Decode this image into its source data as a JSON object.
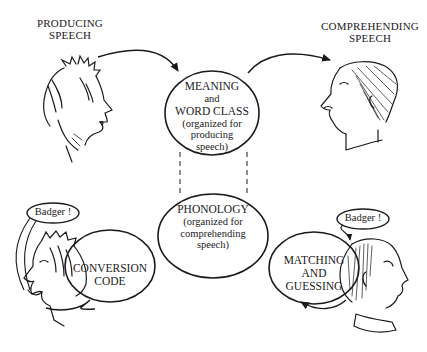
{
  "diagram": {
    "captions": {
      "producing": [
        "PRODUCING",
        "SPEECH"
      ],
      "comprehending": [
        "COMPREHENDING",
        "SPEECH"
      ]
    },
    "nodes": {
      "meaning": {
        "line1": "MEANING",
        "line2": "and",
        "line3": "WORD CLASS",
        "line4": "(organized for",
        "line5": "producing",
        "line6": "speech)"
      },
      "phonology": {
        "line1": "PHONOLOGY",
        "line2": "(organized for",
        "line3": "comprehending",
        "line4": "speech)"
      },
      "conversion": {
        "line1": "CONVERSION",
        "line2": "CODE"
      },
      "matching": {
        "line1": "MATCHING",
        "line2": "AND",
        "line3": "GUESSING"
      }
    },
    "speech_bubbles": {
      "left": "Badger !",
      "right": "Badger !"
    },
    "figures": [
      "speaker-head-top-left",
      "listener-head-top-right",
      "speaker-head-bottom-left",
      "listener-head-bottom-right"
    ],
    "stroke_color": "#1a1a1a",
    "background": "#ffffff"
  }
}
